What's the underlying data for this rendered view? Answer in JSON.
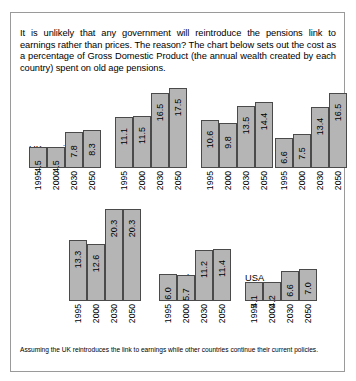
{
  "intro": "It is unlikely that any government will reintroduce the pensions link to earnings rather than prices. The reason? The chart below sets out the cost as a percentage of Gross Domestic Product (the annual wealth created by each country) spent on old age pensions.",
  "footnote": "Assuming the UK reintroduces the link to earnings while other countries continue their current policies.",
  "style": {
    "bar_fill": "#b5b5b5",
    "bar_stroke": "#4a4a4a",
    "border": "#9a9a9a"
  },
  "chart_data": {
    "type": "bar",
    "xlabel": "",
    "ylabel": "% of GDP",
    "categories": [
      "1995",
      "2000",
      "2030",
      "2050"
    ],
    "ylim": [
      0,
      21
    ],
    "grid": false,
    "legend": "none",
    "series": [
      {
        "name": "UK earnings linked",
        "values": [
          4.5,
          4.5,
          7.8,
          8.3
        ]
      },
      {
        "name": "Germany",
        "values": [
          11.1,
          11.5,
          16.5,
          17.5
        ]
      },
      {
        "name": "France",
        "values": [
          10.6,
          9.8,
          13.5,
          14.4
        ]
      },
      {
        "name": "Japan",
        "values": [
          6.6,
          7.5,
          13.4,
          16.5
        ]
      },
      {
        "name": "Italy",
        "values": [
          13.3,
          12.6,
          20.3,
          20.3
        ]
      },
      {
        "name": "Netherlands",
        "values": [
          6.0,
          5.7,
          11.2,
          11.4
        ]
      },
      {
        "name": "USA",
        "values": [
          4.1,
          4.2,
          6.6,
          7.0
        ]
      }
    ]
  },
  "panels": {
    "row1": [
      {
        "key": "uk",
        "title": "UK earnings\nlinked",
        "title_lines": [
          "UK earnings",
          "linked"
        ],
        "labels": [
          "4.5",
          "4.5",
          "7.8",
          "8.3"
        ],
        "years": [
          "1995",
          "2000",
          "2030",
          "2050"
        ]
      },
      {
        "key": "germany",
        "title": "Germany",
        "title_lines": [
          "Germany"
        ],
        "labels": [
          "11.1",
          "11.5",
          "16.5",
          "17.5"
        ],
        "years": [
          "1995",
          "2000",
          "2030",
          "2050"
        ]
      },
      {
        "key": "france",
        "title": "France",
        "title_lines": [
          "France"
        ],
        "labels": [
          "10.6",
          "9.8",
          "13.5",
          "14.4"
        ],
        "years": [
          "1995",
          "2000",
          "2030",
          "2050"
        ]
      },
      {
        "key": "japan",
        "title": "Japan",
        "title_lines": [
          "Japan"
        ],
        "labels": [
          "6.6",
          "7.5",
          "13.4",
          "16.5"
        ],
        "years": [
          "1995",
          "2000",
          "2030",
          "2050"
        ]
      }
    ],
    "row2": [
      {
        "key": "italy",
        "title": "Italy",
        "title_lines": [
          "Italy"
        ],
        "labels": [
          "13.3",
          "12.6",
          "20.3",
          "20.3"
        ],
        "years": [
          "1995",
          "2000",
          "2030",
          "2050"
        ]
      },
      {
        "key": "netherlands",
        "title": "Netherlands",
        "title_lines": [
          "Netherlands"
        ],
        "labels": [
          "6.0",
          "5.7",
          "11.2",
          "11.4"
        ],
        "years": [
          "1995",
          "2000",
          "2030",
          "2050"
        ]
      },
      {
        "key": "usa",
        "title": "USA",
        "title_lines": [
          "USA"
        ],
        "labels": [
          "4.1",
          "4.2",
          "6.6",
          "7.0"
        ],
        "years": [
          "1995",
          "2000",
          "2030",
          "2050"
        ]
      }
    ]
  }
}
